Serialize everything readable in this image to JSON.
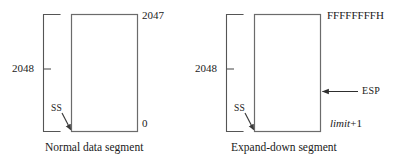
{
  "figure": {
    "ink_color": "#4d4d4d",
    "text_color": "#1a1a1a"
  },
  "panels": [
    {
      "id": "normal",
      "caption": "Normal data segment",
      "size_label": "2048",
      "top_address": "2047",
      "bottom_address": "0",
      "pointer_label": "SS",
      "stack_pointer_label": null
    },
    {
      "id": "expand-down",
      "caption": "Expand-down segment",
      "size_label": "2048",
      "top_address": "FFFFFFFFH",
      "bottom_address_prefix": "limit",
      "bottom_address_suffix": "+1",
      "pointer_label": "SS",
      "stack_pointer_label": "ESP"
    }
  ]
}
